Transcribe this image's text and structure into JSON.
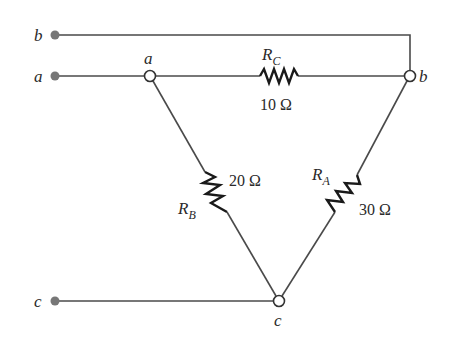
{
  "diagram": {
    "type": "circuit",
    "terminals": [
      {
        "id": "b",
        "label": "b",
        "x": 55,
        "y": 35
      },
      {
        "id": "a",
        "label": "a",
        "x": 55,
        "y": 76
      },
      {
        "id": "c",
        "label": "c",
        "x": 55,
        "y": 301
      }
    ],
    "nodes": [
      {
        "id": "a",
        "label": "a",
        "x": 150,
        "y": 76
      },
      {
        "id": "b",
        "label": "b",
        "x": 410,
        "y": 76
      },
      {
        "id": "c",
        "label": "c",
        "x": 279,
        "y": 301
      }
    ],
    "resistors": [
      {
        "id": "RC",
        "name": "R",
        "subscript": "C",
        "value": "10 Ω",
        "between": [
          "a",
          "b"
        ]
      },
      {
        "id": "RB",
        "name": "R",
        "subscript": "B",
        "value": "20 Ω",
        "between": [
          "a",
          "c"
        ]
      },
      {
        "id": "RA",
        "name": "R",
        "subscript": "A",
        "value": "30 Ω",
        "between": [
          "b",
          "c"
        ]
      }
    ],
    "colors": {
      "wire": "#4a4a4a",
      "terminal_dot": "#777777",
      "resistor": "#1a1a1a",
      "text": "#2a2a2a"
    }
  }
}
